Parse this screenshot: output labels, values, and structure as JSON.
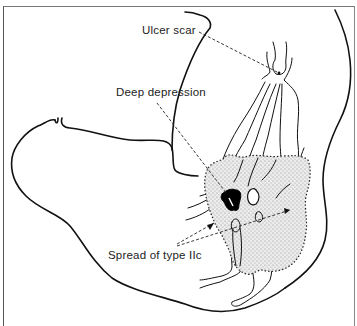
{
  "diagram": {
    "labels": {
      "ulcer_scar": "Ulcer scar",
      "deep_depression": "Deep depression",
      "spread_type_iic": "Spread of type IIc"
    },
    "colors": {
      "line": "#111111",
      "stipple_fill": "#d8d8d8",
      "depression_fill": "#000000",
      "frame": "#666666",
      "background": "#ffffff"
    }
  }
}
